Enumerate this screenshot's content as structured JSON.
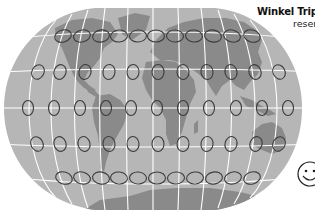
{
  "figure": {
    "title": "Winkel Trip",
    "subtitle": "reser",
    "projection": "Winkel Tripel",
    "icon": "smiley-face-icon"
  },
  "colors": {
    "background": "#ffffff",
    "ocean": "#b6b6b6",
    "land": "#8a8a8a",
    "graticule": "#ffffff",
    "ellipse_stroke": "#3c3c3c"
  },
  "tissot_indicatrix": {
    "rows": [
      {
        "y": 36,
        "rx": 8.5,
        "ry": 6,
        "rotate": [
          -18,
          -14,
          -10,
          -6,
          -3,
          0,
          3,
          6,
          10,
          14,
          18
        ],
        "x": [
          63,
          82,
          101,
          119,
          138,
          156,
          175,
          194,
          213,
          232,
          252
        ]
      },
      {
        "y": 72,
        "rx": 6,
        "ry": 7.5,
        "rotate": [
          28,
          20,
          14,
          8,
          4,
          0,
          -4,
          -8,
          -14,
          -20,
          -28
        ],
        "x": [
          38,
          60,
          85,
          109,
          133,
          158,
          183,
          207,
          231,
          255,
          279
        ]
      },
      {
        "y": 108,
        "rx": 5.5,
        "ry": 7.5,
        "rotate": [
          0,
          0,
          0,
          0,
          0,
          0,
          0,
          0,
          0,
          0,
          0
        ],
        "x": [
          28,
          54,
          80,
          106,
          131,
          157,
          183,
          209,
          236,
          262,
          288
        ]
      },
      {
        "y": 144,
        "rx": 6,
        "ry": 7.5,
        "rotate": [
          -28,
          -20,
          -14,
          -8,
          -4,
          0,
          4,
          8,
          14,
          20,
          28
        ],
        "x": [
          37,
          60,
          84,
          109,
          133,
          158,
          183,
          207,
          231,
          256,
          279
        ]
      },
      {
        "y": 178,
        "rx": 8.5,
        "ry": 6,
        "rotate": [
          18,
          14,
          10,
          6,
          3,
          0,
          -3,
          -6,
          -10,
          -14,
          -18
        ],
        "x": [
          64,
          82,
          101,
          119,
          138,
          157,
          176,
          195,
          214,
          233,
          252
        ]
      }
    ]
  }
}
